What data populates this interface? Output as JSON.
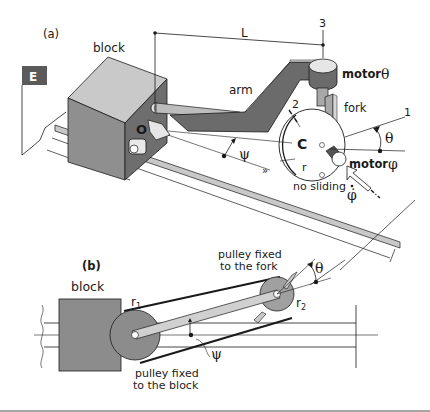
{
  "figure": {
    "panel_a": {
      "label": "(a)",
      "block_label": "block",
      "E_label": "E",
      "L_label": "L",
      "arm_label": "arm",
      "axis3_label": "3",
      "axis2_label": "2",
      "axis1_label": "1",
      "motor_theta_label": "motor",
      "motor_theta_symbol": "θ",
      "fork_label": "fork",
      "O_label": "O",
      "C_label": "C",
      "psi_symbol": "ψ",
      "theta_symbol": "θ",
      "r_label": "r",
      "motor_phi_label": "motor",
      "motor_phi_symbol": "φ",
      "no_sliding_label": "no sliding",
      "phidot_symbol": "φ",
      "arrow_chevrons": "»"
    },
    "panel_b": {
      "label": "(b)",
      "block_label": "block",
      "r1_label": "r",
      "r1_sub": "1",
      "r2_label": "r",
      "r2_sub": "2",
      "pulley_fork_line1": "pulley fixed",
      "pulley_fork_line2": "to the fork",
      "pulley_block_line1": "pulley fixed",
      "pulley_block_line2": "to the block",
      "theta_symbol": "θ",
      "psi_symbol": "ψ"
    },
    "colors": {
      "dark_gray": "#6b6b6b",
      "mid_gray": "#8c8c8c",
      "light_gray": "#c8c8c8",
      "line": "#1a1a1a",
      "E_badge": "#5a5a5a"
    }
  }
}
